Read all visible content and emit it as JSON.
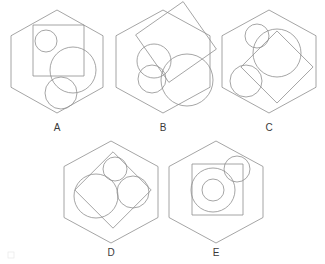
{
  "document": {
    "title": "Geometric Shapes Puzzle",
    "background_color": "#ffffff",
    "stroke_color": "#8e8e8e",
    "label_color": "#3a3a3a",
    "stroke_width": 0.8,
    "width": 325,
    "height": 264
  },
  "figures": [
    {
      "id": "A",
      "label": "A",
      "label_x": 57,
      "label_y": 131,
      "hexagon": {
        "cx": 57,
        "cy": 61.5,
        "rx": 46,
        "ry": 51.5
      },
      "shapes": [
        {
          "kind": "square",
          "x": 33,
          "y": 25,
          "size": 51,
          "rotation": 0
        },
        {
          "kind": "circle",
          "cx": 46,
          "cy": 41,
          "r": 11
        },
        {
          "kind": "circle",
          "cx": 73,
          "cy": 70,
          "r": 23
        },
        {
          "kind": "circle",
          "cx": 61,
          "cy": 93,
          "r": 16
        }
      ]
    },
    {
      "id": "B",
      "label": "B",
      "label_x": 163,
      "label_y": 131,
      "hexagon": {
        "cx": 163,
        "cy": 61.5,
        "rx": 47,
        "ry": 51.5
      },
      "shapes": [
        {
          "kind": "square",
          "cx": 176,
          "cy": 42,
          "size": 58,
          "rotation": -35
        },
        {
          "kind": "circle",
          "cx": 154,
          "cy": 61,
          "r": 17
        },
        {
          "kind": "circle",
          "cx": 152,
          "cy": 79,
          "r": 14
        },
        {
          "kind": "circle",
          "cx": 187,
          "cy": 80,
          "r": 26
        }
      ]
    },
    {
      "id": "C",
      "label": "C",
      "label_x": 269,
      "label_y": 131,
      "hexagon": {
        "cx": 269,
        "cy": 61.5,
        "rx": 47,
        "ry": 51.5
      },
      "shapes": [
        {
          "kind": "square",
          "cx": 277,
          "cy": 67,
          "size": 51,
          "rotation": 45
        },
        {
          "kind": "circle",
          "cx": 257,
          "cy": 36,
          "r": 12
        },
        {
          "kind": "circle",
          "cx": 277,
          "cy": 53,
          "r": 24
        },
        {
          "kind": "circle",
          "cx": 246,
          "cy": 81,
          "r": 16
        }
      ]
    },
    {
      "id": "D",
      "label": "D",
      "label_x": 111,
      "label_y": 256,
      "hexagon": {
        "cx": 111,
        "cy": 192,
        "rx": 47,
        "ry": 51
      },
      "shapes": [
        {
          "kind": "square",
          "cx": 113,
          "cy": 190,
          "size": 54,
          "rotation": 45
        },
        {
          "kind": "circle",
          "cx": 115,
          "cy": 169,
          "r": 12
        },
        {
          "kind": "circle",
          "cx": 96,
          "cy": 196,
          "r": 22
        },
        {
          "kind": "circle",
          "cx": 133,
          "cy": 192,
          "r": 16
        }
      ]
    },
    {
      "id": "E",
      "label": "E",
      "label_x": 216,
      "label_y": 256,
      "hexagon": {
        "cx": 216,
        "cy": 192,
        "rx": 47,
        "ry": 51
      },
      "shapes": [
        {
          "kind": "square",
          "x": 192,
          "y": 164,
          "size": 51,
          "rotation": 0
        },
        {
          "kind": "circle",
          "cx": 237,
          "cy": 169,
          "r": 13
        },
        {
          "kind": "circle",
          "cx": 213,
          "cy": 190,
          "r": 22
        },
        {
          "kind": "circle",
          "cx": 213,
          "cy": 190,
          "r": 11
        }
      ]
    }
  ],
  "artifacts": {
    "corner_speck": {
      "x": 8,
      "y": 252,
      "width": 6,
      "height": 6
    }
  }
}
